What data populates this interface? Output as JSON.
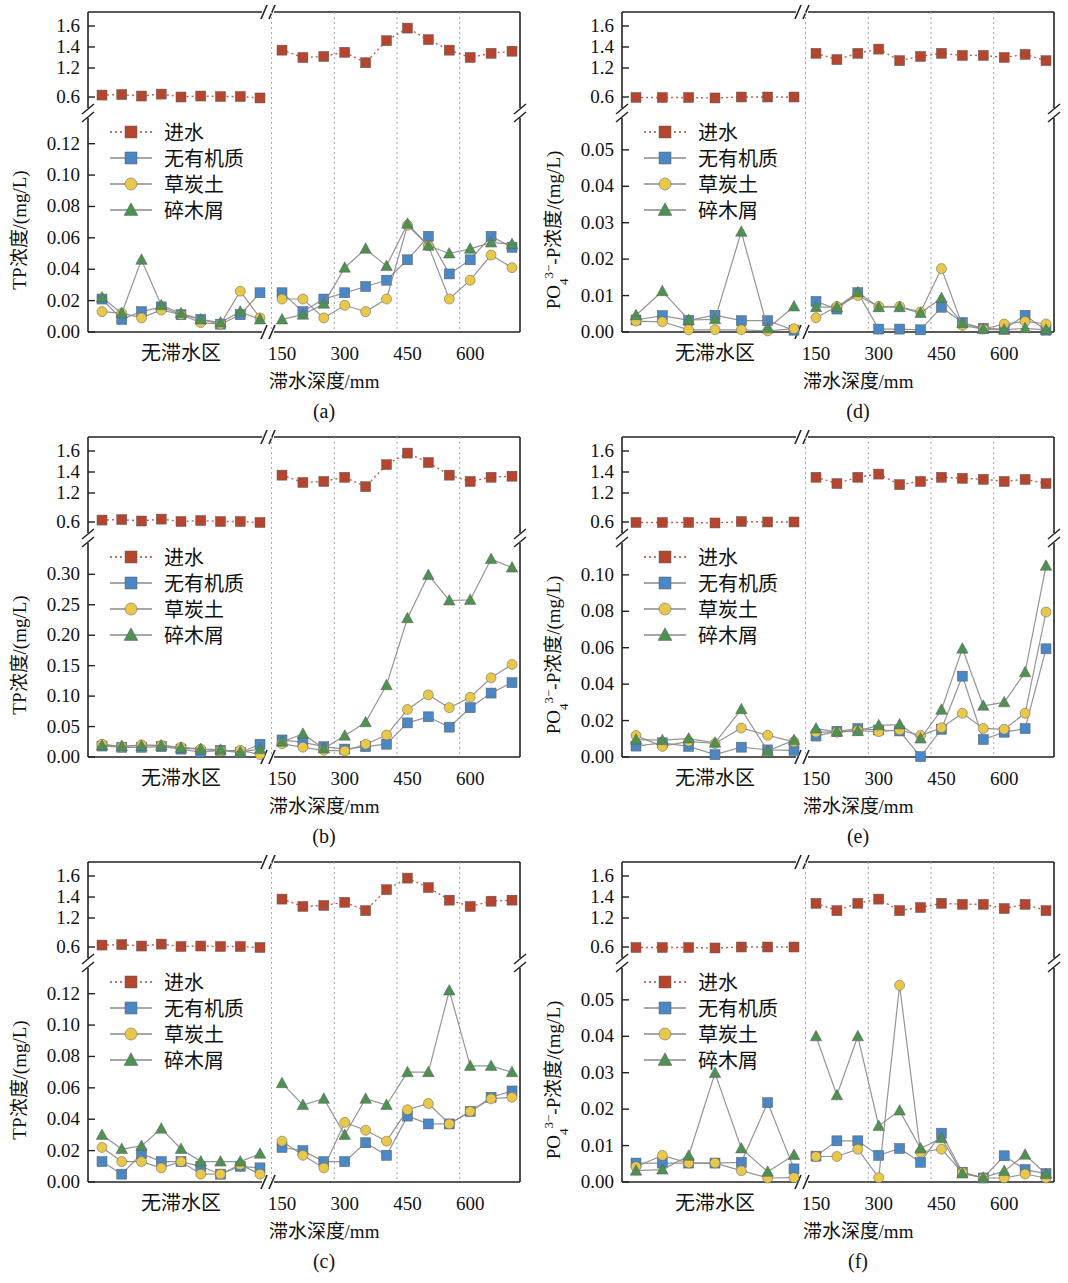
{
  "figure": {
    "colors": {
      "influent": "#b4452f",
      "no_organic": "#4a87c4",
      "peat_soil": "#e8c84a",
      "wood_chips": "#4e9152",
      "line_gray": "#8a8a8a",
      "grid_dotted": "#9aa7b5",
      "axis": "#222222"
    },
    "series_names": {
      "influent": "进水",
      "no_organic": "无有机质",
      "peat_soil": "草炭土",
      "wood_chips": "碎木屑"
    },
    "x_category_label": "无滞水区",
    "x_tick_labels": [
      "150",
      "300",
      "450",
      "600"
    ],
    "x_axis_title": "滞水深度/mm",
    "upper_axis_ticks": [
      "1.6",
      "1.4",
      "1.2",
      "0.6"
    ],
    "upper_axis_break": true,
    "subplot_labels": [
      "(a)",
      "(b)",
      "(c)",
      "(d)",
      "(e)",
      "(f)"
    ]
  },
  "chart_data": [
    {
      "id": "a",
      "type": "line",
      "label": "(a)",
      "title": "",
      "ylabel": "TP浓度/(mg/L)",
      "xlabel": "滞水深度/mm",
      "ylim": [
        0,
        0.13
      ],
      "yticks": [
        0.0,
        0.02,
        0.04,
        0.06,
        0.08,
        0.1,
        0.12
      ],
      "ytick_labels": [
        "0.00",
        "0.02",
        "0.04",
        "0.06",
        "0.08",
        "0.10",
        "0.12"
      ],
      "upper_ylim": [
        0.55,
        1.68
      ],
      "upper_yticks": [
        0.6,
        1.2,
        1.4,
        1.6
      ],
      "x_left_category": "无滞水区",
      "x_right_ticks": [
        150,
        300,
        450,
        600
      ],
      "grid": "vertical-dotted",
      "legend_position": "left-middle",
      "series": [
        {
          "name": "进水",
          "axis": "upper",
          "left": [
            0.64,
            0.65,
            0.62,
            0.66,
            0.6,
            0.62,
            0.61,
            0.61,
            0.58
          ],
          "right": [
            1.37,
            1.3,
            1.31,
            1.35,
            1.25,
            1.46,
            1.58,
            1.47,
            1.37,
            1.3,
            1.34,
            1.36
          ]
        },
        {
          "name": "无有机质",
          "axis": "lower",
          "left": [
            0.021,
            0.008,
            0.013,
            0.016,
            0.011,
            0.008,
            0.005,
            0.011,
            0.025
          ],
          "right": [
            0.025,
            0.013,
            0.021,
            0.025,
            0.029,
            0.033,
            0.046,
            0.061,
            0.037,
            0.046,
            0.061,
            0.054
          ]
        },
        {
          "name": "草炭土",
          "axis": "lower",
          "left": [
            0.013,
            0.012,
            0.009,
            0.014,
            0.011,
            0.006,
            0.005,
            0.026,
            0.009
          ],
          "right": [
            0.021,
            0.021,
            0.009,
            0.017,
            0.013,
            0.021,
            0.068,
            0.055,
            0.021,
            0.033,
            0.049,
            0.041
          ]
        },
        {
          "name": "碎木屑",
          "axis": "lower",
          "left": [
            0.022,
            0.012,
            0.046,
            0.017,
            0.012,
            0.008,
            0.006,
            0.013,
            0.008
          ],
          "right": [
            0.008,
            0.011,
            0.018,
            0.041,
            0.053,
            0.042,
            0.069,
            0.055,
            0.05,
            0.053,
            0.057,
            0.056
          ]
        }
      ]
    },
    {
      "id": "b",
      "type": "line",
      "label": "(b)",
      "title": "",
      "ylabel": "TP浓度/(mg/L)",
      "xlabel": "滞水深度/mm",
      "ylim": [
        0,
        0.335
      ],
      "yticks": [
        0.0,
        0.05,
        0.1,
        0.15,
        0.2,
        0.25,
        0.3
      ],
      "ytick_labels": [
        "0.00",
        "0.05",
        "0.10",
        "0.15",
        "0.20",
        "0.25",
        "0.30"
      ],
      "upper_ylim": [
        0.55,
        1.68
      ],
      "upper_yticks": [
        0.6,
        1.2,
        1.4,
        1.6
      ],
      "x_left_category": "无滞水区",
      "x_right_ticks": [
        150,
        300,
        450,
        600
      ],
      "grid": "vertical-dotted",
      "legend_position": "left-middle",
      "series": [
        {
          "name": "进水",
          "axis": "upper",
          "left": [
            0.64,
            0.65,
            0.62,
            0.66,
            0.61,
            0.63,
            0.61,
            0.61,
            0.59
          ],
          "right": [
            1.37,
            1.3,
            1.31,
            1.35,
            1.26,
            1.47,
            1.58,
            1.49,
            1.37,
            1.31,
            1.35,
            1.36
          ]
        },
        {
          "name": "无有机质",
          "axis": "lower",
          "left": [
            0.018,
            0.016,
            0.016,
            0.017,
            0.013,
            0.008,
            0.011,
            0.007,
            0.021
          ],
          "right": [
            0.028,
            0.024,
            0.017,
            0.013,
            0.017,
            0.021,
            0.056,
            0.066,
            0.049,
            0.081,
            0.105,
            0.122
          ]
        },
        {
          "name": "草炭土",
          "axis": "lower",
          "left": [
            0.021,
            0.017,
            0.02,
            0.019,
            0.016,
            0.013,
            0.01,
            0.011,
            0.004
          ],
          "right": [
            0.022,
            0.016,
            0.011,
            0.01,
            0.021,
            0.036,
            0.078,
            0.102,
            0.081,
            0.098,
            0.13,
            0.152
          ]
        },
        {
          "name": "碎木屑",
          "axis": "lower",
          "left": [
            0.019,
            0.018,
            0.018,
            0.019,
            0.015,
            0.013,
            0.012,
            0.008,
            0.013
          ],
          "right": [
            0.025,
            0.038,
            0.014,
            0.035,
            0.057,
            0.118,
            0.228,
            0.299,
            0.257,
            0.258,
            0.325,
            0.311
          ]
        }
      ]
    },
    {
      "id": "c",
      "type": "line",
      "label": "(c)",
      "title": "",
      "ylabel": "TP浓度/(mg/L)",
      "xlabel": "滞水深度/mm",
      "ylim": [
        0,
        0.13
      ],
      "yticks": [
        0.0,
        0.02,
        0.04,
        0.06,
        0.08,
        0.1,
        0.12
      ],
      "ytick_labels": [
        "0.00",
        "0.02",
        "0.04",
        "0.06",
        "0.08",
        "0.10",
        "0.12"
      ],
      "upper_ylim": [
        0.55,
        1.68
      ],
      "upper_yticks": [
        0.6,
        1.2,
        1.4,
        1.6
      ],
      "x_left_category": "无滞水区",
      "x_right_ticks": [
        150,
        300,
        450,
        600
      ],
      "grid": "vertical-dotted",
      "legend_position": "left-middle",
      "series": [
        {
          "name": "进水",
          "axis": "upper",
          "left": [
            0.64,
            0.65,
            0.62,
            0.66,
            0.61,
            0.62,
            0.61,
            0.61,
            0.59
          ],
          "right": [
            1.38,
            1.31,
            1.32,
            1.35,
            1.27,
            1.47,
            1.58,
            1.49,
            1.37,
            1.31,
            1.36,
            1.37
          ]
        },
        {
          "name": "无有机质",
          "axis": "lower",
          "left": [
            0.013,
            0.005,
            0.018,
            0.013,
            0.013,
            0.01,
            0.005,
            0.01,
            0.009
          ],
          "right": [
            0.022,
            0.02,
            0.013,
            0.013,
            0.025,
            0.017,
            0.042,
            0.037,
            0.037,
            0.045,
            0.054,
            0.058
          ]
        },
        {
          "name": "草炭土",
          "axis": "lower",
          "left": [
            0.022,
            0.013,
            0.013,
            0.009,
            0.013,
            0.005,
            0.005,
            0.011,
            0.005
          ],
          "right": [
            0.026,
            0.017,
            0.009,
            0.038,
            0.033,
            0.026,
            0.046,
            0.05,
            0.037,
            0.045,
            0.053,
            0.054
          ]
        },
        {
          "name": "碎木屑",
          "axis": "lower",
          "left": [
            0.03,
            0.021,
            0.023,
            0.034,
            0.021,
            0.013,
            0.013,
            0.013,
            0.018
          ],
          "right": [
            0.063,
            0.049,
            0.053,
            0.03,
            0.053,
            0.049,
            0.07,
            0.07,
            0.122,
            0.074,
            0.074,
            0.07
          ]
        }
      ]
    },
    {
      "id": "d",
      "type": "line",
      "label": "(d)",
      "title": "",
      "ylabel": "PO₄³⁻-P浓度/(mg/L)",
      "xlabel": "滞水深度/mm",
      "ylim": [
        0,
        0.056
      ],
      "yticks": [
        0.0,
        0.01,
        0.02,
        0.03,
        0.04,
        0.05
      ],
      "ytick_labels": [
        "0.00",
        "0.01",
        "0.02",
        "0.03",
        "0.04",
        "0.05"
      ],
      "upper_ylim": [
        0.55,
        1.68
      ],
      "upper_yticks": [
        0.6,
        1.2,
        1.4,
        1.6
      ],
      "x_left_category": "无滞水区",
      "x_right_ticks": [
        150,
        300,
        450,
        600
      ],
      "grid": "vertical-dotted",
      "legend_position": "left-middle",
      "series": [
        {
          "name": "进水",
          "axis": "upper",
          "left": [
            0.59,
            0.59,
            0.59,
            0.58,
            0.6,
            0.6,
            0.6
          ],
          "right": [
            1.34,
            1.28,
            1.34,
            1.38,
            1.27,
            1.31,
            1.34,
            1.32,
            1.32,
            1.3,
            1.33,
            1.27
          ]
        },
        {
          "name": "无有机质",
          "axis": "lower",
          "left": [
            0.0033,
            0.0045,
            0.0032,
            0.0046,
            0.0031,
            0.0031,
            0.0005
          ],
          "right": [
            0.0084,
            0.0063,
            0.0108,
            0.0008,
            0.0008,
            0.0006,
            0.0068,
            0.0026,
            0.001,
            0.0008,
            0.0046,
            0.0005
          ]
        },
        {
          "name": "草炭土",
          "axis": "lower",
          "left": [
            0.003,
            0.0028,
            0.0006,
            0.0006,
            0.0006,
            0.0003,
            0.0009
          ],
          "right": [
            0.0039,
            0.007,
            0.01,
            0.007,
            0.007,
            0.0055,
            0.0174,
            0.0018,
            0.0008,
            0.0022,
            0.0029,
            0.0022
          ]
        },
        {
          "name": "碎木屑",
          "axis": "lower",
          "left": [
            0.0046,
            0.0112,
            0.0033,
            0.0035,
            0.0275,
            0.001,
            0.007
          ],
          "right": [
            0.0068,
            0.0068,
            0.0109,
            0.0068,
            0.0068,
            0.0052,
            0.0093,
            0.0024,
            0.0008,
            0.0006,
            0.001,
            0.0006
          ]
        }
      ]
    },
    {
      "id": "e",
      "type": "line",
      "label": "(e)",
      "title": "",
      "ylabel": "PO₄³⁻-P浓度/(mg/L)",
      "xlabel": "滞水深度/mm",
      "ylim": [
        0,
        0.112
      ],
      "yticks": [
        0.0,
        0.02,
        0.04,
        0.06,
        0.08,
        0.1
      ],
      "ytick_labels": [
        "0.00",
        "0.02",
        "0.04",
        "0.06",
        "0.08",
        "0.10"
      ],
      "upper_ylim": [
        0.55,
        1.68
      ],
      "upper_yticks": [
        0.6,
        1.2,
        1.4,
        1.6
      ],
      "x_left_category": "无滞水区",
      "x_right_ticks": [
        150,
        300,
        450,
        600
      ],
      "grid": "vertical-dotted",
      "legend_position": "left-middle",
      "series": [
        {
          "name": "进水",
          "axis": "upper",
          "left": [
            0.59,
            0.59,
            0.59,
            0.58,
            0.61,
            0.6,
            0.6
          ],
          "right": [
            1.35,
            1.29,
            1.35,
            1.38,
            1.28,
            1.31,
            1.35,
            1.34,
            1.33,
            1.31,
            1.33,
            1.29
          ]
        },
        {
          "name": "无有机质",
          "axis": "lower",
          "left": [
            0.006,
            0.0078,
            0.0058,
            0.0013,
            0.0054,
            0.0039,
            0.0036
          ],
          "right": [
            0.0115,
            0.0141,
            0.0156,
            0.0148,
            0.0143,
            0.0002,
            0.0152,
            0.0444,
            0.0096,
            0.0136,
            0.0156,
            0.0594
          ]
        },
        {
          "name": "草炭土",
          "axis": "lower",
          "left": [
            0.0118,
            0.0058,
            0.0086,
            0.0074,
            0.0159,
            0.0119,
            0.0083
          ],
          "right": [
            0.0136,
            0.0136,
            0.0145,
            0.0139,
            0.0148,
            0.0118,
            0.0161,
            0.024,
            0.0157,
            0.0152,
            0.024,
            0.0796
          ]
        },
        {
          "name": "碎木屑",
          "axis": "lower",
          "left": [
            0.0095,
            0.0092,
            0.0101,
            0.0078,
            0.0262,
            0.0033,
            0.0093
          ],
          "right": [
            0.0156,
            0.0138,
            0.0142,
            0.0174,
            0.0178,
            0.0101,
            0.0259,
            0.0595,
            0.0281,
            0.03,
            0.0465,
            0.105
          ]
        }
      ]
    },
    {
      "id": "f",
      "type": "line",
      "label": "(f)",
      "title": "",
      "ylabel": "PO₄³⁻-P浓度/(mg/L)",
      "xlabel": "滞水深度/mm",
      "ylim": [
        0,
        0.056
      ],
      "yticks": [
        0.0,
        0.01,
        0.02,
        0.03,
        0.04,
        0.05
      ],
      "ytick_labels": [
        "0.00",
        "0.01",
        "0.02",
        "0.03",
        "0.04",
        "0.05"
      ],
      "upper_ylim": [
        0.55,
        1.68
      ],
      "upper_yticks": [
        0.6,
        1.2,
        1.4,
        1.6
      ],
      "x_left_category": "无滞水区",
      "x_right_ticks": [
        150,
        300,
        450,
        600
      ],
      "grid": "vertical-dotted",
      "legend_position": "left-middle",
      "series": [
        {
          "name": "进水",
          "axis": "upper",
          "left": [
            0.59,
            0.59,
            0.59,
            0.58,
            0.6,
            0.6,
            0.6
          ],
          "right": [
            1.34,
            1.27,
            1.34,
            1.38,
            1.27,
            1.3,
            1.34,
            1.33,
            1.33,
            1.29,
            1.33,
            1.27
          ]
        },
        {
          "name": "无有机质",
          "axis": "lower",
          "left": [
            0.0052,
            0.0052,
            0.0052,
            0.0052,
            0.0054,
            0.0218,
            0.0036
          ],
          "right": [
            0.0071,
            0.0113,
            0.0113,
            0.0073,
            0.0092,
            0.0054,
            0.0134,
            0.0027,
            0.0011,
            0.0072,
            0.0034,
            0.0023
          ]
        },
        {
          "name": "草炭土",
          "axis": "lower",
          "left": [
            0.0042,
            0.0073,
            0.0052,
            0.0052,
            0.0031,
            0.0011,
            0.0012
          ],
          "right": [
            0.007,
            0.007,
            0.009,
            0.0012,
            0.054,
            0.0082,
            0.009,
            0.0026,
            0.0011,
            0.0011,
            0.0022,
            0.0011
          ]
        },
        {
          "name": "碎木屑",
          "axis": "lower",
          "left": [
            0.0031,
            0.0034,
            0.0072,
            0.0299,
            0.0092,
            0.0028,
            0.0074
          ],
          "right": [
            0.04,
            0.0238,
            0.04,
            0.0154,
            0.0196,
            0.0092,
            0.012,
            0.0023,
            0.0012,
            0.003,
            0.0075,
            0.0022
          ]
        }
      ]
    }
  ]
}
